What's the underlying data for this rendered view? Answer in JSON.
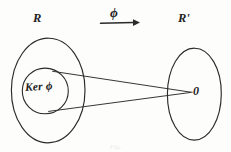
{
  "figure": {
    "kind": "hand-drawn-math-diagram",
    "background_color": "#fdfdfc",
    "ink_color": "#2b2b2b"
  },
  "labels": {
    "domain_set": "R",
    "codomain_set": "R'",
    "map": "ϕ",
    "kernel": "Ker ϕ",
    "zero_element": "0"
  },
  "caption": "Fig.",
  "shapes": {
    "domain_ellipse": {
      "cx": 48,
      "cy": 90,
      "rx": 37,
      "ry": 52
    },
    "codomain_ellipse": {
      "cx": 194,
      "cy": 94,
      "rx": 27,
      "ry": 46
    },
    "kernel_circle": {
      "cx": 45,
      "cy": 91,
      "r": 23
    },
    "zero_point": {
      "x": 190,
      "y": 92
    },
    "cone_top_start": {
      "x": 53,
      "y": 71
    },
    "cone_bottom_start": {
      "x": 49,
      "y": 111
    }
  },
  "arrow": {
    "label": "ϕ",
    "x1": 100,
    "x2": 139,
    "y": 23,
    "direction": "left-to-right"
  }
}
